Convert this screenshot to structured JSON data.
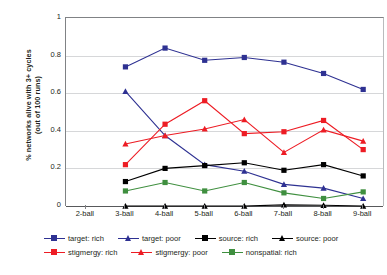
{
  "chart_data": {
    "type": "line",
    "title": "",
    "xlabel": "",
    "ylabel": "% networks alive with 3+ cycles (out of 100 runs)",
    "ylabel_line1": "% networks alive with 3+ cycles",
    "ylabel_line2": "(out of 100 runs)",
    "categories": [
      "2-ball",
      "3-ball",
      "4-ball",
      "5-ball",
      "6-ball",
      "7-ball",
      "8-ball",
      "9-ball"
    ],
    "x": [
      0,
      1,
      2,
      3,
      4,
      5,
      6,
      7
    ],
    "ylim": [
      0,
      1
    ],
    "yticks": [
      0,
      0.2,
      0.4,
      0.6,
      0.8,
      1
    ],
    "ytick_labels": [
      "0",
      "0.2",
      "0.4",
      "0.6",
      "0.8",
      "1"
    ],
    "grid": "horizontal",
    "legend_position": "bottom",
    "series": [
      {
        "name": "target: rich",
        "color": "#2e3192",
        "marker": "square",
        "values": [
          null,
          0.74,
          0.84,
          0.775,
          0.79,
          0.765,
          0.705,
          0.62
        ]
      },
      {
        "name": "target: poor",
        "color": "#2e3192",
        "marker": "triangle",
        "values": [
          null,
          0.61,
          0.375,
          0.22,
          0.185,
          0.115,
          0.095,
          0.04
        ]
      },
      {
        "name": "source: rich",
        "color": "#000000",
        "marker": "square",
        "values": [
          null,
          0.13,
          0.2,
          0.215,
          0.23,
          0.19,
          0.22,
          0.16
        ]
      },
      {
        "name": "source: poor",
        "color": "#000000",
        "marker": "triangle",
        "values": [
          null,
          0.0,
          0.0,
          0.0,
          0.0,
          0.006,
          0.004,
          0.0
        ]
      },
      {
        "name": "stigmergy: rich",
        "color": "#ed1c24",
        "marker": "square",
        "values": [
          null,
          0.22,
          0.435,
          0.56,
          0.385,
          0.395,
          0.455,
          0.3
        ]
      },
      {
        "name": "stigmergy: poor",
        "color": "#ed1c24",
        "marker": "triangle",
        "values": [
          null,
          0.33,
          0.375,
          0.41,
          0.46,
          0.285,
          0.405,
          0.345
        ]
      },
      {
        "name": "nonspatial: rich",
        "color": "#3f8f3f",
        "marker": "square",
        "values": [
          null,
          0.08,
          0.125,
          0.08,
          0.125,
          0.07,
          0.04,
          0.075
        ]
      }
    ]
  },
  "legend": {
    "rows": [
      [
        {
          "label": "target: rich",
          "color": "#2e3192",
          "marker": "square"
        },
        {
          "label": "target: poor",
          "color": "#2e3192",
          "marker": "triangle"
        },
        {
          "label": "source: rich",
          "color": "#000000",
          "marker": "square"
        },
        {
          "label": "source: poor",
          "color": "#000000",
          "marker": "triangle"
        }
      ],
      [
        {
          "label": "stigmergy: rich",
          "color": "#ed1c24",
          "marker": "square"
        },
        {
          "label": "stigmergy: poor",
          "color": "#ed1c24",
          "marker": "triangle"
        },
        {
          "label": "nonspatial: rich",
          "color": "#3f8f3f",
          "marker": "square"
        }
      ]
    ]
  }
}
